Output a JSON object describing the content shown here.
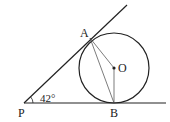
{
  "diagram": {
    "type": "geometry",
    "points": {
      "P": {
        "label": "P",
        "x": 24,
        "y": 103
      },
      "A": {
        "label": "A",
        "x": 90,
        "y": 38
      },
      "B": {
        "label": "B",
        "x": 114,
        "y": 103
      },
      "O": {
        "label": "O",
        "x": 114,
        "y": 68
      }
    },
    "circle": {
      "center": "O",
      "radius": 35
    },
    "angle_label": "42°",
    "colors": {
      "stroke": "#222222",
      "background": "#ffffff"
    }
  }
}
